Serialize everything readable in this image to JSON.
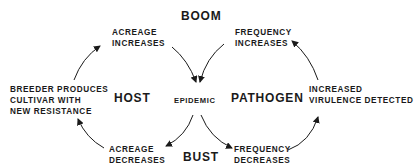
{
  "diagram": {
    "type": "boom-and-bust cycle",
    "top_label": "BOOM",
    "bottom_label": "BUST",
    "center_label": "EPIDEMIC",
    "left_label": "HOST",
    "right_label": "PATHOGEN",
    "nodes": {
      "acreage_increases": [
        "ACREAGE",
        "INCREASES"
      ],
      "frequency_increases": [
        "FREQUENCY",
        "INCREASES"
      ],
      "increased_virulence": [
        "INCREASED",
        "VIRULENCE DETECTED"
      ],
      "frequency_decreases": [
        "FREQUENCY",
        "DECREASES"
      ],
      "acreage_decreases": [
        "ACREAGE",
        "DECREASES"
      ],
      "breeder_produces": [
        "BREEDER PRODUCES",
        "CULTIVAR WITH",
        "NEW RESISTANCE"
      ]
    },
    "edges": [
      {
        "from": "BREEDER PRODUCES CULTIVAR WITH NEW RESISTANCE",
        "to": "ACREAGE INCREASES"
      },
      {
        "from": "ACREAGE INCREASES",
        "to": "EPIDEMIC"
      },
      {
        "from": "FREQUENCY INCREASES",
        "to": "EPIDEMIC"
      },
      {
        "from": "EPIDEMIC",
        "to": "ACREAGE DECREASES"
      },
      {
        "from": "EPIDEMIC",
        "to": "FREQUENCY DECREASES"
      },
      {
        "from": "FREQUENCY DECREASES",
        "to": "INCREASED VIRULENCE DETECTED"
      },
      {
        "from": "INCREASED VIRULENCE DETECTED",
        "to": "FREQUENCY INCREASES"
      },
      {
        "from": "ACREAGE DECREASES",
        "to": "BREEDER PRODUCES CULTIVAR WITH NEW RESISTANCE"
      }
    ],
    "colors": {
      "ink": "#1a1a1a",
      "background": "#ffffff"
    }
  }
}
